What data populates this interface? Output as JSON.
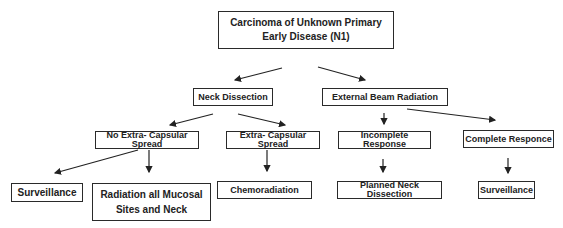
{
  "nodes": {
    "root": {
      "line1": "Carcinoma of Unknown Primary",
      "line2": "Early Disease (N1)"
    },
    "neck_dissection": {
      "label": "Neck Dissection"
    },
    "ebr": {
      "label": "External Beam Radiation"
    },
    "no_ecs": {
      "label": "No Extra- Capsular Spread"
    },
    "ecs": {
      "label": "Extra- Capsular Spread"
    },
    "incomplete": {
      "label": "Incomplete Response"
    },
    "complete": {
      "label": "Complete Responce"
    },
    "surveillance_1": {
      "label": "Surveillance"
    },
    "radiation_all": {
      "line1": "Radiation all Mucosal",
      "line2": "Sites and Neck"
    },
    "chemoradiation": {
      "label": "Chemoradiation"
    },
    "planned_nd": {
      "label": "Planned Neck Dissection"
    },
    "surveillance_2": {
      "label": "Surveillance"
    }
  }
}
